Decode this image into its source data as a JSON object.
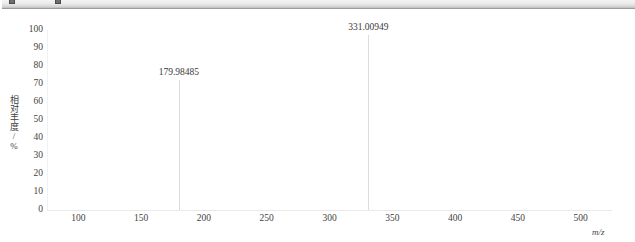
{
  "app_ruler": {
    "marker_left_name": "indent-marker",
    "marker_right_name": "tab-stop-marker"
  },
  "chart_data": {
    "type": "line",
    "title": "",
    "subtitle": "",
    "xlabel": "m/z",
    "ylabel": "相对丰度/%",
    "xlim": [
      75,
      525
    ],
    "ylim": [
      0,
      100
    ],
    "grid": false,
    "legend": null,
    "x_ticks": [
      100,
      150,
      200,
      250,
      300,
      350,
      400,
      450,
      500
    ],
    "y_ticks": [
      0,
      10,
      20,
      30,
      40,
      50,
      60,
      70,
      80,
      90,
      100
    ],
    "x_tick_labels": [
      "100",
      "150",
      "200",
      "250",
      "300",
      "350",
      "400",
      "450",
      "500"
    ],
    "y_tick_labels": [
      "0",
      "10",
      "20",
      "30",
      "40",
      "50",
      "60",
      "70",
      "80",
      "90",
      "100"
    ],
    "peaks": [
      {
        "mz": 179.98485,
        "label": "179.98485",
        "intensity": 72
      },
      {
        "mz": 331.00949,
        "label": "331.00949",
        "intensity": 97
      }
    ],
    "series": [
      {
        "name": "mass spectrum",
        "x": [
          179.98485,
          331.00949
        ],
        "values": [
          72,
          97
        ]
      }
    ],
    "colors": {
      "peak": "#dcdcdc",
      "axis": "#e9e9e9",
      "text": "#3a3a3a",
      "background": "#ffffff"
    }
  }
}
